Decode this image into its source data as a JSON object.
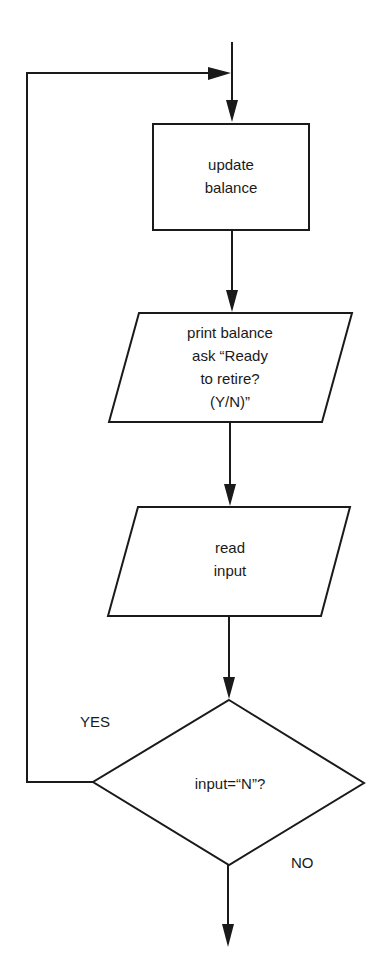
{
  "diagram": {
    "type": "flowchart",
    "nodes": [
      {
        "id": "update",
        "shape": "process",
        "lines": [
          "update",
          "balance"
        ]
      },
      {
        "id": "print",
        "shape": "input-output",
        "lines": [
          "print balance",
          "ask “Ready",
          "to retire?",
          "(Y/N)”"
        ]
      },
      {
        "id": "read",
        "shape": "input-output",
        "lines": [
          "read",
          "input"
        ]
      },
      {
        "id": "decision",
        "shape": "decision",
        "lines": [
          "input=“N”?"
        ]
      }
    ],
    "edges": [
      {
        "from": "start",
        "to": "update"
      },
      {
        "from": "update",
        "to": "print"
      },
      {
        "from": "print",
        "to": "read"
      },
      {
        "from": "read",
        "to": "decision"
      },
      {
        "from": "decision",
        "to": "update",
        "label": "YES"
      },
      {
        "from": "decision",
        "to": "end",
        "label": "NO"
      }
    ],
    "branch_labels": {
      "yes": "YES",
      "no": "NO"
    }
  }
}
